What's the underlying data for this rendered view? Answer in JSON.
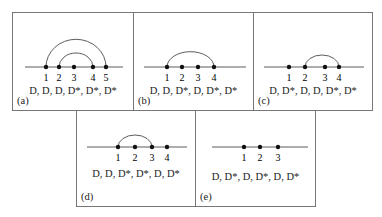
{
  "panels": [
    {
      "id": "a",
      "label": "(a)",
      "sequence": "D, D, D, D*, D*, D*",
      "nodes": [
        "1",
        "2",
        "3",
        "4",
        "5"
      ],
      "arcs": [
        [
          1,
          5
        ],
        [
          2,
          4
        ]
      ]
    },
    {
      "id": "b",
      "label": "(b)",
      "sequence": "D, D, D*, D, D*, D*",
      "nodes": [
        "1",
        "2",
        "3",
        "4"
      ],
      "arcs": [
        [
          1,
          4
        ]
      ]
    },
    {
      "id": "c",
      "label": "(c)",
      "sequence": "D, D*, D, D, D*, D*",
      "nodes": [
        "1",
        "2",
        "3",
        "4"
      ],
      "arcs": [
        [
          2,
          4
        ]
      ]
    },
    {
      "id": "d",
      "label": "(d)",
      "sequence": "D, D, D*, D*, D, D*",
      "nodes": [
        "1",
        "2",
        "3",
        "4"
      ],
      "arcs": [
        [
          1,
          3
        ]
      ]
    },
    {
      "id": "e",
      "label": "(e)",
      "sequence": "D, D*, D, D*, D, D*",
      "nodes": [
        "1",
        "2",
        "3"
      ],
      "arcs": []
    }
  ]
}
